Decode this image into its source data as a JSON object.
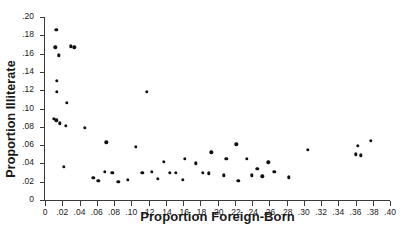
{
  "chart_data": {
    "type": "scatter",
    "title": "",
    "xlabel": "Proportion Foreign-Born",
    "ylabel": "Proportion Illiterate",
    "xlim": [
      0,
      0.4
    ],
    "ylim": [
      0,
      0.2
    ],
    "grid": false,
    "legend": null,
    "xticks": [
      0,
      0.02,
      0.04,
      0.06,
      0.08,
      0.1,
      0.12,
      0.14,
      0.16,
      0.18,
      0.2,
      0.22,
      0.24,
      0.26,
      0.28,
      0.3,
      0.32,
      0.34,
      0.36,
      0.38,
      0.4
    ],
    "xtick_labels": [
      "0",
      ".02",
      ".04",
      ".06",
      ".08",
      ".10",
      ".12",
      ".14",
      ".16",
      ".18",
      ".20",
      ".22",
      ".24",
      ".26",
      ".28",
      ".30",
      ".32",
      ".34",
      ".36",
      ".38",
      ".40"
    ],
    "yticks": [
      0,
      0.02,
      0.04,
      0.06,
      0.08,
      0.1,
      0.12,
      0.14,
      0.16,
      0.18,
      0.2
    ],
    "ytick_labels": [
      "0",
      ".02",
      ".04",
      ".06",
      ".08",
      ".10",
      ".12",
      ".14",
      ".16",
      ".18",
      ".20"
    ],
    "marker": "filled-circle",
    "marker_color": "#111111",
    "points": [
      {
        "x": 0.013,
        "y": 0.186
      },
      {
        "x": 0.012,
        "y": 0.167
      },
      {
        "x": 0.03,
        "y": 0.168
      },
      {
        "x": 0.034,
        "y": 0.167
      },
      {
        "x": 0.016,
        "y": 0.158
      },
      {
        "x": 0.014,
        "y": 0.13
      },
      {
        "x": 0.014,
        "y": 0.118
      },
      {
        "x": 0.118,
        "y": 0.118
      },
      {
        "x": 0.025,
        "y": 0.106
      },
      {
        "x": 0.01,
        "y": 0.089
      },
      {
        "x": 0.013,
        "y": 0.087
      },
      {
        "x": 0.017,
        "y": 0.084
      },
      {
        "x": 0.024,
        "y": 0.081
      },
      {
        "x": 0.046,
        "y": 0.079
      },
      {
        "x": 0.071,
        "y": 0.063
      },
      {
        "x": 0.105,
        "y": 0.058
      },
      {
        "x": 0.305,
        "y": 0.055
      },
      {
        "x": 0.363,
        "y": 0.059
      },
      {
        "x": 0.378,
        "y": 0.065
      },
      {
        "x": 0.36,
        "y": 0.05
      },
      {
        "x": 0.366,
        "y": 0.049
      },
      {
        "x": 0.222,
        "y": 0.061
      },
      {
        "x": 0.193,
        "y": 0.052
      },
      {
        "x": 0.21,
        "y": 0.045
      },
      {
        "x": 0.234,
        "y": 0.045
      },
      {
        "x": 0.162,
        "y": 0.045
      },
      {
        "x": 0.175,
        "y": 0.04
      },
      {
        "x": 0.259,
        "y": 0.041
      },
      {
        "x": 0.138,
        "y": 0.042
      },
      {
        "x": 0.022,
        "y": 0.036
      },
      {
        "x": 0.246,
        "y": 0.034
      },
      {
        "x": 0.266,
        "y": 0.031
      },
      {
        "x": 0.069,
        "y": 0.031
      },
      {
        "x": 0.078,
        "y": 0.03
      },
      {
        "x": 0.113,
        "y": 0.03
      },
      {
        "x": 0.124,
        "y": 0.031
      },
      {
        "x": 0.145,
        "y": 0.03
      },
      {
        "x": 0.152,
        "y": 0.03
      },
      {
        "x": 0.183,
        "y": 0.03
      },
      {
        "x": 0.19,
        "y": 0.029
      },
      {
        "x": 0.207,
        "y": 0.027
      },
      {
        "x": 0.224,
        "y": 0.021
      },
      {
        "x": 0.24,
        "y": 0.027
      },
      {
        "x": 0.252,
        "y": 0.026
      },
      {
        "x": 0.283,
        "y": 0.025
      },
      {
        "x": 0.16,
        "y": 0.022
      },
      {
        "x": 0.131,
        "y": 0.023
      },
      {
        "x": 0.096,
        "y": 0.022
      },
      {
        "x": 0.085,
        "y": 0.02
      },
      {
        "x": 0.062,
        "y": 0.021
      },
      {
        "x": 0.056,
        "y": 0.024
      }
    ]
  }
}
